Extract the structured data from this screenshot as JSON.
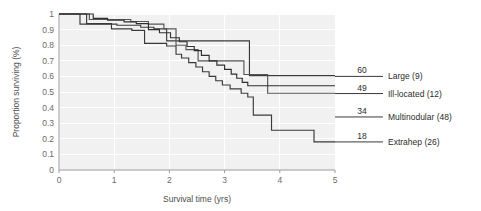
{
  "chart_data": {
    "type": "line",
    "title": "",
    "subtitle": "",
    "xlabel": "Survival time (yrs)",
    "ylabel": "Proportion surviving (%)",
    "xlim": [
      0,
      5
    ],
    "ylim": [
      0,
      1
    ],
    "xticks": [
      "0",
      "1",
      "2",
      "3",
      "4",
      "5"
    ],
    "xtick_values": [
      0,
      1,
      2,
      3,
      4,
      5
    ],
    "yticks": [
      "0",
      "0.1",
      "0.2",
      "0.3",
      "0.4",
      "0.5",
      "0.6",
      "0.7",
      "0.8",
      "0.9",
      "1"
    ],
    "ytick_values": [
      0,
      0.1,
      0.2,
      0.3,
      0.4,
      0.5,
      0.6,
      0.7,
      0.8,
      0.9,
      1
    ],
    "grid": true,
    "grid_color": "#ffffff",
    "plot_background": "#f1f1f1",
    "legend_position": "right",
    "step_style": "post",
    "annotations": [
      {
        "name": "end-value-large",
        "text": "60",
        "series": "Large (9)"
      },
      {
        "name": "end-value-ill-located",
        "text": "49",
        "series": "Ill-located (12)"
      },
      {
        "name": "end-value-multinodular",
        "text": "34",
        "series": "Multinodular (48)"
      },
      {
        "name": "end-value-extrahep",
        "text": "18",
        "series": "Extrahep (26)"
      }
    ],
    "series": [
      {
        "name": "Large (9)",
        "label": "Large (9)",
        "n": 9,
        "end_value_label": "60",
        "final_proportion": 0.6,
        "color": "#3a3a3a",
        "line_width": 1.15,
        "points": [
          [
            0.0,
            1.0
          ],
          [
            0.38,
            1.0
          ],
          [
            0.38,
            0.935
          ],
          [
            1.05,
            0.935
          ],
          [
            1.05,
            0.928
          ],
          [
            1.48,
            0.928
          ],
          [
            1.48,
            0.915
          ],
          [
            1.72,
            0.915
          ],
          [
            1.72,
            0.905
          ],
          [
            1.95,
            0.905
          ],
          [
            1.95,
            0.828
          ],
          [
            3.45,
            0.828
          ],
          [
            3.45,
            0.605
          ],
          [
            5.0,
            0.605
          ]
        ]
      },
      {
        "name": "Ill-located (12)",
        "label": "Ill-located (12)",
        "n": 12,
        "end_value_label": "49",
        "final_proportion": 0.49,
        "color": "#555555",
        "line_width": 1.15,
        "points": [
          [
            0.0,
            1.0
          ],
          [
            0.55,
            1.0
          ],
          [
            0.55,
            0.965
          ],
          [
            1.3,
            0.965
          ],
          [
            1.3,
            0.952
          ],
          [
            1.62,
            0.952
          ],
          [
            1.62,
            0.935
          ],
          [
            1.9,
            0.935
          ],
          [
            1.9,
            0.905
          ],
          [
            2.12,
            0.905
          ],
          [
            2.12,
            0.8
          ],
          [
            2.3,
            0.8
          ],
          [
            2.3,
            0.772
          ],
          [
            2.52,
            0.772
          ],
          [
            2.52,
            0.7
          ],
          [
            3.35,
            0.7
          ],
          [
            3.35,
            0.612
          ],
          [
            3.78,
            0.612
          ],
          [
            3.78,
            0.492
          ],
          [
            5.0,
            0.492
          ]
        ]
      },
      {
        "name": "Multinodular (48)",
        "label": "Multinodular (48)",
        "n": 48,
        "end_value_label": "34",
        "final_proportion": 0.34,
        "color": "#2f2f2f",
        "line_width": 1.15,
        "points": [
          [
            0.0,
            1.0
          ],
          [
            0.62,
            1.0
          ],
          [
            0.62,
            0.972
          ],
          [
            0.88,
            0.972
          ],
          [
            0.88,
            0.96
          ],
          [
            1.18,
            0.96
          ],
          [
            1.18,
            0.95
          ],
          [
            1.4,
            0.95
          ],
          [
            1.4,
            0.938
          ],
          [
            1.62,
            0.938
          ],
          [
            1.62,
            0.9
          ],
          [
            1.82,
            0.9
          ],
          [
            1.82,
            0.88
          ],
          [
            2.02,
            0.88
          ],
          [
            2.02,
            0.848
          ],
          [
            2.18,
            0.848
          ],
          [
            2.18,
            0.822
          ],
          [
            2.32,
            0.822
          ],
          [
            2.32,
            0.792
          ],
          [
            2.45,
            0.792
          ],
          [
            2.45,
            0.765
          ],
          [
            2.58,
            0.765
          ],
          [
            2.58,
            0.735
          ],
          [
            2.72,
            0.735
          ],
          [
            2.72,
            0.7
          ],
          [
            2.86,
            0.7
          ],
          [
            2.86,
            0.672
          ],
          [
            3.0,
            0.672
          ],
          [
            3.0,
            0.645
          ],
          [
            3.12,
            0.645
          ],
          [
            3.12,
            0.615
          ],
          [
            3.22,
            0.615
          ],
          [
            3.22,
            0.588
          ],
          [
            3.32,
            0.588
          ],
          [
            3.32,
            0.562
          ],
          [
            3.42,
            0.562
          ],
          [
            3.42,
            0.54
          ],
          [
            5.0,
            0.54
          ]
        ]
      },
      {
        "name": "Extrahep (26)",
        "label": "Extrahep (26)",
        "n": 26,
        "end_value_label": "18",
        "final_proportion": 0.18,
        "color": "#3a3a3a",
        "line_width": 1.15,
        "points": [
          [
            0.0,
            1.0
          ],
          [
            0.5,
            1.0
          ],
          [
            0.5,
            0.938
          ],
          [
            0.95,
            0.938
          ],
          [
            0.95,
            0.905
          ],
          [
            1.32,
            0.905
          ],
          [
            1.32,
            0.895
          ],
          [
            1.55,
            0.895
          ],
          [
            1.55,
            0.812
          ],
          [
            1.95,
            0.812
          ],
          [
            1.95,
            0.795
          ],
          [
            2.12,
            0.795
          ],
          [
            2.12,
            0.742
          ],
          [
            2.22,
            0.742
          ],
          [
            2.22,
            0.718
          ],
          [
            2.35,
            0.718
          ],
          [
            2.35,
            0.688
          ],
          [
            2.48,
            0.688
          ],
          [
            2.48,
            0.66
          ],
          [
            2.6,
            0.66
          ],
          [
            2.6,
            0.63
          ],
          [
            2.72,
            0.63
          ],
          [
            2.72,
            0.6
          ],
          [
            2.84,
            0.6
          ],
          [
            2.84,
            0.572
          ],
          [
            2.96,
            0.572
          ],
          [
            2.96,
            0.545
          ],
          [
            3.1,
            0.545
          ],
          [
            3.1,
            0.52
          ],
          [
            3.3,
            0.52
          ],
          [
            3.3,
            0.492
          ],
          [
            3.42,
            0.492
          ],
          [
            3.42,
            0.468
          ],
          [
            3.52,
            0.468
          ],
          [
            3.52,
            0.352
          ],
          [
            3.85,
            0.352
          ],
          [
            3.85,
            0.255
          ],
          [
            4.62,
            0.255
          ],
          [
            4.62,
            0.18
          ],
          [
            5.0,
            0.18
          ]
        ]
      }
    ]
  },
  "legend": {
    "entries": [
      {
        "value": "60",
        "label": "Large (9)"
      },
      {
        "value": "49",
        "label": "Ill-located (12)"
      },
      {
        "value": "34",
        "label": "Multinodular (48)"
      },
      {
        "value": "18",
        "label": "Extrahep (26)"
      }
    ]
  }
}
